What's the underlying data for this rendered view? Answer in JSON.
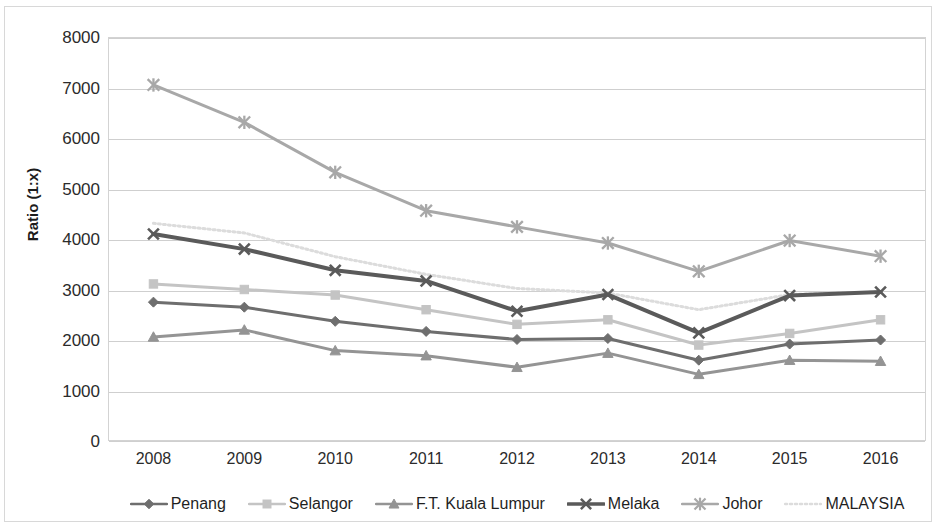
{
  "chart_data": {
    "type": "line",
    "title": "",
    "xlabel": "",
    "ylabel": "Ratio (1:x)",
    "categories": [
      "2008",
      "2009",
      "2010",
      "2011",
      "2012",
      "2013",
      "2014",
      "2015",
      "2016"
    ],
    "ylim": [
      0,
      8000
    ],
    "ytick_labels": [
      "8000",
      "7000",
      "6000",
      "5000",
      "4000",
      "3000",
      "2000",
      "1000",
      "0"
    ],
    "ytick_values": [
      8000,
      7000,
      6000,
      5000,
      4000,
      3000,
      2000,
      1000,
      0
    ],
    "grid": true,
    "legend_position": "bottom",
    "series": [
      {
        "name": "Penang",
        "marker": "diamond",
        "color": "#6e6e6e",
        "line_style": "solid",
        "line_width": 3,
        "values": [
          2750,
          2650,
          2370,
          2170,
          2010,
          2030,
          1600,
          1920,
          2000
        ]
      },
      {
        "name": "Selangor",
        "marker": "square",
        "color": "#c4c4c4",
        "line_style": "solid",
        "line_width": 3,
        "values": [
          3110,
          3000,
          2890,
          2600,
          2310,
          2400,
          1900,
          2130,
          2400
        ]
      },
      {
        "name": "F.T. Kuala Lumpur",
        "marker": "triangle",
        "color": "#949494",
        "line_style": "solid",
        "line_width": 3,
        "values": [
          2060,
          2200,
          1790,
          1690,
          1460,
          1740,
          1320,
          1600,
          1580
        ]
      },
      {
        "name": "Melaka",
        "marker": "x",
        "color": "#5a5a5a",
        "line_style": "solid",
        "line_width": 4,
        "values": [
          4100,
          3800,
          3380,
          3170,
          2570,
          2900,
          2140,
          2880,
          2950
        ]
      },
      {
        "name": "Johor",
        "marker": "asterisk",
        "color": "#a8a8a8",
        "line_style": "solid",
        "line_width": 3,
        "values": [
          7050,
          6310,
          5320,
          4560,
          4240,
          3920,
          3360,
          3970,
          3660
        ]
      },
      {
        "name": "MALAYSIA",
        "marker": "none",
        "color": "#dcdcdc",
        "line_style": "dotted",
        "line_width": 3,
        "values": [
          4310,
          4120,
          3650,
          3300,
          3020,
          2930,
          2600,
          2900,
          2950
        ]
      }
    ]
  },
  "axis": {
    "y_title": "Ratio (1:x)"
  },
  "colors": {
    "gridline": "#cfcfcf",
    "plot_border": "#d3d3d3",
    "figure_border": "#d8d8d8",
    "text": "#2b2b2b",
    "background": "#ffffff"
  }
}
